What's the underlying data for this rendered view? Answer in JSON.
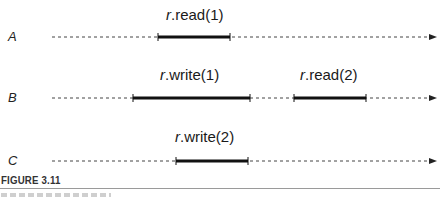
{
  "figure": {
    "title": "FIGURE 3.11",
    "colors": {
      "timeline": "#333333",
      "interval": "#111111",
      "rule": "#9a9a9a"
    }
  },
  "threads": [
    {
      "name": "A",
      "y": 37,
      "intervals": [
        {
          "receiver": "r",
          "method": ".read(1)",
          "start": 158,
          "end": 230
        }
      ]
    },
    {
      "name": "B",
      "y": 98,
      "intervals": [
        {
          "receiver": "r",
          "method": ".write(1)",
          "start": 133,
          "end": 250
        },
        {
          "receiver": "r",
          "method": ".read(2)",
          "start": 294,
          "end": 366
        }
      ]
    },
    {
      "name": "C",
      "y": 161,
      "intervals": [
        {
          "receiver": "r",
          "method": ".write(2)",
          "start": 176,
          "end": 248
        }
      ]
    }
  ]
}
